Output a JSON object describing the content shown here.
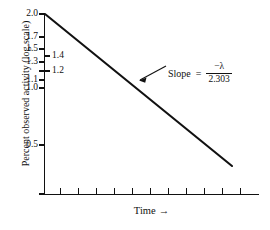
{
  "chart_data": {
    "type": "line",
    "title": "",
    "subtitle": "",
    "xlabel": "Time",
    "xlabel_arrow": "→",
    "ylabel": "Percent observed activity (log scale)",
    "y_scale": "log",
    "grid": false,
    "legend": null,
    "xlim": [
      0,
      12
    ],
    "ylim": [
      0.2,
      2.0
    ],
    "x_ticks_count": 11,
    "x_tick_labels": [],
    "y_tick_labels_primary": [
      "2.0",
      "1.7",
      "1.5",
      "1.3",
      "1.1",
      "1.0",
      "0.5"
    ],
    "y_tick_values_primary": [
      2.0,
      1.7,
      1.5,
      1.3,
      1.1,
      1.0,
      0.5
    ],
    "y_tick_labels_secondary": [
      "1.4",
      "1.2"
    ],
    "y_tick_values_secondary": [
      1.4,
      1.2
    ],
    "series": [
      {
        "name": "observed activity decay",
        "x": [
          0.0,
          10.0
        ],
        "y": [
          2.0,
          0.26
        ],
        "color": "#111111",
        "linewidth": 2
      }
    ],
    "annotations": [
      {
        "name": "slope-annotation",
        "label": "Slope",
        "equals": "=",
        "numerator": "−λ",
        "denominator": "2.303",
        "points_to_x": 5.2,
        "points_to_y": 0.95
      }
    ]
  },
  "axes": {
    "y_primary": [
      {
        "label": "2.0",
        "y_px": 14
      },
      {
        "label": "1.7",
        "y_px": 37
      },
      {
        "label": "1.5",
        "y_px": 49
      },
      {
        "label": "1.3",
        "y_px": 62
      },
      {
        "label": "1.1",
        "y_px": 80
      },
      {
        "label": "1.0",
        "y_px": 88
      },
      {
        "label": "0.5",
        "y_px": 145
      }
    ],
    "y_secondary": [
      {
        "label": "1.4",
        "y_px": 56
      },
      {
        "label": "1.2",
        "y_px": 71
      }
    ],
    "y_ticks_px": [
      14,
      37,
      49,
      62,
      71,
      80,
      88,
      145,
      194
    ],
    "y_ticks_inner_px": [
      56,
      71
    ],
    "x_ticks_px": [
      60,
      78,
      96,
      114,
      132,
      150,
      168,
      186,
      204,
      222,
      240
    ],
    "color_axis": "#111111"
  },
  "annotation_text": {
    "slope_label": "Slope",
    "equals_sign": "=",
    "numerator": "−λ",
    "denominator": "2.303"
  }
}
